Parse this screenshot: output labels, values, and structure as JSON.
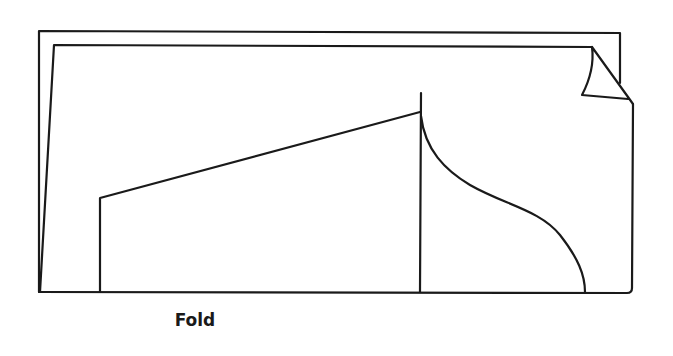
{
  "figure": {
    "type": "pattern-piece-diagram",
    "caption": "Fold",
    "elements": [
      "outer-page-outline",
      "inner-page-outline-with-curled-corner",
      "pattern-piece-outline"
    ],
    "colors": {
      "background": "#ffffff",
      "line": "#1a1a1a"
    }
  }
}
